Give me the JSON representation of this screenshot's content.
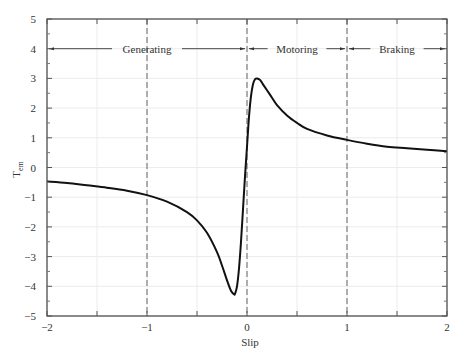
{
  "chart_data": {
    "type": "line",
    "title": "",
    "xlabel": "Slip",
    "ylabel": "T_em",
    "ylabel_main": "T",
    "ylabel_sub": "em",
    "xlim": [
      -2,
      2
    ],
    "ylim": [
      -5,
      5
    ],
    "xticks": [
      -2,
      -1,
      0,
      1,
      2
    ],
    "yticks": [
      5,
      4,
      3,
      2,
      1,
      0,
      -1,
      -2,
      -3,
      -4,
      -5
    ],
    "xtick_labels": [
      "−2",
      "−1",
      "0",
      "1",
      "2"
    ],
    "ytick_labels": [
      "5",
      "4",
      "3",
      "2",
      "1",
      "0",
      "−1",
      "−2",
      "−3",
      "−4",
      "−5"
    ],
    "grid": true,
    "region_boundaries": [
      -1,
      0,
      1
    ],
    "regions": [
      {
        "label": "Generating",
        "x_start": -2,
        "x_end": 0,
        "y": 4
      },
      {
        "label": "Motoring",
        "x_start": 0,
        "x_end": 1,
        "y": 4
      },
      {
        "label": "Braking",
        "x_start": 1,
        "x_end": 2,
        "y": 4
      }
    ],
    "series": [
      {
        "name": "Torque vs Slip",
        "color": "#111111",
        "x": [
          -2.0,
          -1.8,
          -1.6,
          -1.4,
          -1.2,
          -1.0,
          -0.8,
          -0.6,
          -0.5,
          -0.4,
          -0.3,
          -0.25,
          -0.2,
          -0.16,
          -0.13,
          -0.12,
          -0.1,
          -0.08,
          -0.06,
          -0.04,
          -0.02,
          0.0,
          0.02,
          0.04,
          0.06,
          0.08,
          0.1,
          0.13,
          0.16,
          0.2,
          0.25,
          0.3,
          0.4,
          0.5,
          0.6,
          0.8,
          1.0,
          1.2,
          1.4,
          1.6,
          1.8,
          2.0
        ],
        "y": [
          -0.47,
          -0.52,
          -0.6,
          -0.68,
          -0.78,
          -0.93,
          -1.15,
          -1.5,
          -1.78,
          -2.2,
          -2.85,
          -3.3,
          -3.8,
          -4.15,
          -4.27,
          -4.25,
          -4.0,
          -3.4,
          -2.5,
          -1.4,
          -0.3,
          0.7,
          1.7,
          2.4,
          2.8,
          2.97,
          3.0,
          2.95,
          2.8,
          2.6,
          2.35,
          2.1,
          1.75,
          1.5,
          1.3,
          1.08,
          0.93,
          0.8,
          0.7,
          0.65,
          0.6,
          0.55
        ]
      }
    ]
  },
  "caption": {
    "text": ""
  }
}
